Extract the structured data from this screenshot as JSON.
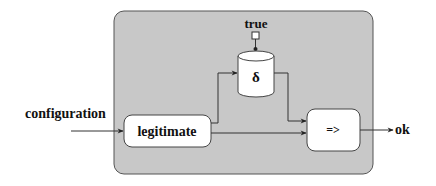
{
  "diagram": {
    "container": {
      "fill": "#c8c8c8",
      "stroke": "#555555"
    },
    "input_label": "configuration",
    "output_label": "ok",
    "constant_label": "true",
    "nodes": {
      "legitimate": {
        "label": "legitimate",
        "shape": "rounded-rect"
      },
      "delta": {
        "label": "δ",
        "shape": "cylinder"
      },
      "implies": {
        "label": "=>",
        "shape": "rounded-rect"
      }
    },
    "edges": [
      {
        "from": "configuration",
        "to": "legitimate"
      },
      {
        "from": "legitimate",
        "to": "delta"
      },
      {
        "from": "legitimate",
        "to": "implies"
      },
      {
        "from": "delta",
        "to": "implies"
      },
      {
        "from": "true",
        "to": "delta"
      },
      {
        "from": "implies",
        "to": "ok"
      }
    ],
    "colors": {
      "node_fill": "#ffffff",
      "line": "#333333",
      "text": "#111111"
    }
  }
}
